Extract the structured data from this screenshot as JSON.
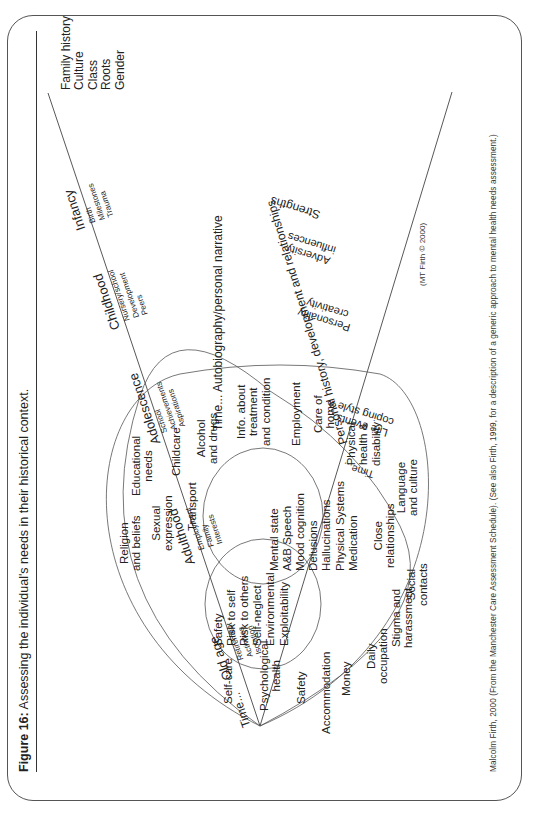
{
  "figure": {
    "label": "Figure 16:",
    "title": "Assessing the individual's needs in their historical context."
  },
  "footer": "Malcolm Firth, 2000 (From the Manchester Care Assessment Schedule). (See also Firth, 1999, for a description of a generic approach to mental health needs assessment.)",
  "copyright": "(MT Firth © 2000)",
  "cone": {
    "upper_line_label": "Time...",
    "center_label": "Time... Autobiography/personal narrative",
    "lower_line_label": "Personal history, development and relationships",
    "lower_time_label": "Time...",
    "tip_items": [
      "Family history",
      "Culture",
      "Class",
      "Roots",
      "Gender"
    ]
  },
  "life_stages": [
    {
      "name": "Old age",
      "items": [
        "Retirement",
        "Activities",
        "Isolation"
      ]
    },
    {
      "name": "Adulthood",
      "items": [
        "Employment",
        "Family",
        "Interests"
      ]
    },
    {
      "name": "Adolescence",
      "items": [
        "School",
        "Achievements",
        "Aspirations"
      ]
    },
    {
      "name": "Childhood",
      "items": [
        "Nursery/school",
        "Development",
        "Peers"
      ]
    },
    {
      "name": "Infancy",
      "items": [
        "Birth",
        "Milestones",
        "Trauma"
      ]
    }
  ],
  "lower_factors": [
    {
      "name": "Strengths"
    },
    {
      "name": "Adversity",
      "sub": "influences"
    },
    {
      "name": "Personality",
      "sub": "creativity"
    },
    {
      "name": "Life events",
      "sub": "coping style"
    }
  ],
  "outer_needs": {
    "self_care": "Self-care",
    "psych_health": [
      "Psychological",
      "health"
    ],
    "safety": "Safety",
    "accommodation": "Accommodation",
    "money": "Money",
    "daily_occupation": [
      "Daily",
      "occupation"
    ],
    "stigma": [
      "Stigma and",
      "harassment"
    ],
    "social_contacts": [
      "Social",
      "contacts"
    ],
    "close_relationships": [
      "Close",
      "relationships"
    ],
    "language_culture": [
      "Language",
      "and culture"
    ],
    "religion": [
      "Religion",
      "and beliefs"
    ],
    "sexual_expression": [
      "Sexual",
      "expression"
    ],
    "transport": "Transport",
    "educational": [
      "Educational",
      "needs"
    ],
    "childcare": "Childcare",
    "alcohol": [
      "Alcohol",
      "and drugs"
    ],
    "info_treatment": [
      "Info. about",
      "treatment",
      "and condition"
    ],
    "employment": "Employment",
    "care_of_home": [
      "Care of",
      "home"
    ],
    "physical_health": [
      "Physical",
      "health &",
      "disability"
    ]
  },
  "risk_circle": [
    "Safety",
    "Risk to self",
    "Risk to others",
    "Self-neglect",
    "Environmental",
    "Exploitability"
  ],
  "mental_state_circle": [
    "Mental state",
    "A&B Speech",
    "Mood cognition",
    "Delusions",
    "Hallucinations",
    "Physical Systems",
    "Medication"
  ]
}
